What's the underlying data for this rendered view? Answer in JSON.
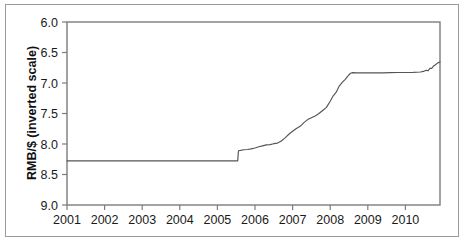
{
  "chart_data": {
    "type": "line",
    "title": "",
    "xlabel": "",
    "ylabel": "RMB/$ (inverted scale)",
    "ylim": [
      6.0,
      9.0
    ],
    "y_inverted": true,
    "xlim": [
      2001.0,
      2010.92
    ],
    "grid": false,
    "legend": null,
    "legend_position": "none",
    "line_color": "#555555",
    "y_ticks": [
      "6.0",
      "6.5",
      "7.0",
      "7.5",
      "8.0",
      "8.5",
      "9.0"
    ],
    "y_tick_values": [
      6.0,
      6.5,
      7.0,
      7.5,
      8.0,
      8.5,
      9.0
    ],
    "x_ticks": [
      "2001",
      "2002",
      "2003",
      "2004",
      "2005",
      "2006",
      "2007",
      "2008",
      "2009",
      "2010"
    ],
    "x_tick_values": [
      2001,
      2002,
      2003,
      2004,
      2005,
      2006,
      2007,
      2008,
      2009,
      2010
    ],
    "series": [
      {
        "name": "RMB per US dollar",
        "x": [
          2001.0,
          2001.25,
          2001.5,
          2001.75,
          2002.0,
          2002.25,
          2002.5,
          2002.75,
          2003.0,
          2003.25,
          2003.5,
          2003.75,
          2004.0,
          2004.25,
          2004.5,
          2004.75,
          2005.0,
          2005.25,
          2005.45,
          2005.54,
          2005.56,
          2005.62,
          2005.7,
          2005.8,
          2005.9,
          2006.0,
          2006.1,
          2006.2,
          2006.3,
          2006.4,
          2006.5,
          2006.6,
          2006.7,
          2006.8,
          2006.9,
          2007.0,
          2007.1,
          2007.2,
          2007.3,
          2007.4,
          2007.5,
          2007.6,
          2007.7,
          2007.8,
          2007.9,
          2008.0,
          2008.08,
          2008.16,
          2008.24,
          2008.32,
          2008.4,
          2008.48,
          2008.54,
          2008.6,
          2008.7,
          2008.8,
          2008.9,
          2009.0,
          2009.2,
          2009.4,
          2009.6,
          2009.8,
          2010.0,
          2010.2,
          2010.4,
          2010.48,
          2010.55,
          2010.6,
          2010.65,
          2010.7,
          2010.75,
          2010.8,
          2010.86,
          2010.92
        ],
        "y": [
          8.277,
          8.277,
          8.276,
          8.277,
          8.277,
          8.277,
          8.277,
          8.277,
          8.277,
          8.277,
          8.277,
          8.277,
          8.277,
          8.277,
          8.277,
          8.277,
          8.277,
          8.277,
          8.277,
          8.277,
          8.11,
          8.105,
          8.095,
          8.09,
          8.08,
          8.065,
          8.045,
          8.03,
          8.015,
          8.01,
          7.995,
          7.985,
          7.95,
          7.9,
          7.84,
          7.79,
          7.745,
          7.71,
          7.65,
          7.6,
          7.57,
          7.54,
          7.5,
          7.45,
          7.4,
          7.3,
          7.21,
          7.15,
          7.05,
          6.99,
          6.94,
          6.88,
          6.84,
          6.83,
          6.835,
          6.832,
          6.835,
          6.835,
          6.833,
          6.835,
          6.83,
          6.828,
          6.828,
          6.826,
          6.82,
          6.81,
          6.79,
          6.8,
          6.76,
          6.76,
          6.72,
          6.7,
          6.67,
          6.655
        ]
      }
    ],
    "annotations": []
  },
  "axes": {
    "y_axis_title": "RMB/$ (inverted scale)"
  }
}
